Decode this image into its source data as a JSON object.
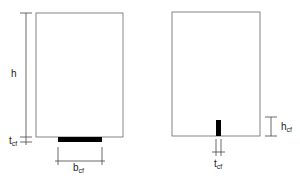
{
  "diagram": {
    "left_panel": {
      "labels": {
        "height": "h",
        "thickness_main": "t",
        "thickness_sub": "cf",
        "width_main": "b",
        "width_sub": "cf"
      }
    },
    "right_panel": {
      "labels": {
        "height_main": "h",
        "height_sub": "cf",
        "thickness_main": "t",
        "thickness_sub": "cf"
      }
    },
    "colors": {
      "outline": "#555555",
      "fill": "#000000",
      "background": "#ffffff"
    }
  }
}
